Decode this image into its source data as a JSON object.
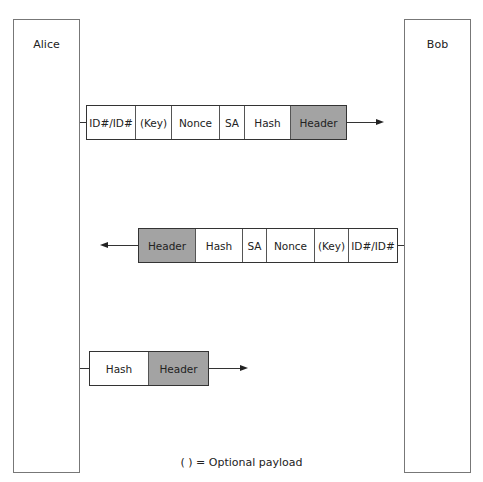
{
  "parties": {
    "alice": "Alice",
    "bob": "Bob"
  },
  "messages": [
    {
      "direction": "Alice to Bob",
      "fields": [
        "ID#/ID#",
        "(Key)",
        "Nonce",
        "SA",
        "Hash",
        "Header"
      ],
      "shaded": [
        "Header"
      ]
    },
    {
      "direction": "Bob to Alice",
      "fields": [
        "Header",
        "Hash",
        "SA",
        "Nonce",
        "(Key)",
        "ID#/ID#"
      ],
      "shaded": [
        "Header"
      ]
    },
    {
      "direction": "Alice to Bob",
      "fields": [
        "Hash",
        "Header"
      ],
      "shaded": [
        "Header"
      ]
    }
  ],
  "legend": "( ) = Optional payload",
  "colors": {
    "shaded": "#a3a3a3",
    "border": "#333333"
  }
}
